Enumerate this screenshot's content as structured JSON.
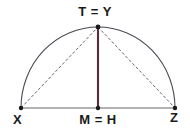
{
  "figure": {
    "kind": "geometry-diagram",
    "labels": {
      "apex": "T = Y",
      "midpoint": "M = H",
      "left": "X",
      "right": "Z"
    },
    "colors": {
      "arc": "#4a4a55",
      "baseline": "#9a9a9a",
      "altitude": "#5a2a3a",
      "dashed": "#555560",
      "point": "#1a1a1a",
      "text": "#1a1a1a",
      "background": "#ffffff"
    },
    "points": {
      "left": {
        "name": "X",
        "x": 21,
        "y": 108
      },
      "right": {
        "name": "Z",
        "x": 175,
        "y": 108
      },
      "midpoint": {
        "name": "M = H",
        "x": 98,
        "y": 108
      },
      "apex": {
        "name": "T = Y",
        "x": 98,
        "y": 27
      }
    },
    "segments": {
      "baseline": "X to Z",
      "altitude": "T=Y to M=H",
      "chord_left": "X to T=Y",
      "chord_right": "T=Y to Z",
      "arc": "semicircular arc from X over T=Y to Z"
    },
    "arc": {
      "radius": 77,
      "center_x": 98,
      "center_y": 108
    }
  }
}
